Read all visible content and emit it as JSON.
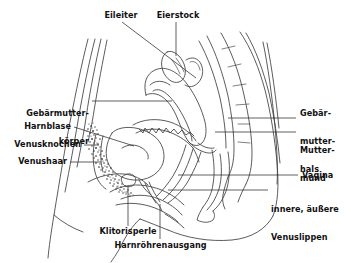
{
  "figure": {
    "background_color": "#ffffff",
    "line_color": "#3a3a3a",
    "text_color": "#111111",
    "width": 351,
    "height": 263
  },
  "labels": {
    "eileiter": "Eileiter",
    "eierstock": "Eierstock",
    "gebaermutterkoerper_line1": "Gebärmutter-",
    "gebaermutterkoerper_line2": "körper",
    "harnblase": "Harnblase",
    "venusknochen": "Venusknochen",
    "venushaar": "Venushaar",
    "gebaermutterhals_line1": "Gebär-",
    "gebaermutterhals_line2": "mutter-",
    "gebaermutterhals_line3": "hals",
    "muttermund_line1": "Mutter-",
    "muttermund_line2": "mund",
    "vagina": "Vagina",
    "venuslippen_line1": "innere, äußere",
    "venuslippen_line2": "Venuslippen",
    "klitorisperle": "Klitorisperle",
    "harnroehrenausgang": "Harnröhrenausgang"
  }
}
